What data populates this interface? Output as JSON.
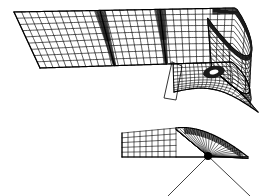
{
  "figure": {
    "title": "",
    "background_color": "#ffffff",
    "line_color": "#000000",
    "width": 271,
    "height": 196
  },
  "chart_data": {
    "type": "line",
    "title": "",
    "xlabel": "",
    "ylabel": "",
    "grid": true,
    "legend": false,
    "panels": [
      {
        "name": "upper-surface-mesh",
        "label": "3D wireframe wing surface",
        "mesh_color": "#000000",
        "planform": {
          "leading_edge": [
            [
              14,
              12
            ],
            [
              236,
              8
            ]
          ],
          "trailing_edge": [
            [
              40,
              68
            ],
            [
              232,
              62
            ]
          ],
          "left_tip": [
            [
              14,
              12
            ],
            [
              40,
              68
            ]
          ],
          "root_chord_x": 236
        },
        "spanwise_divisions": 34,
        "chordwise_divisions": 9,
        "crease_positions_x": [
          100,
          160
        ],
        "crease_shading": "#1a1a1a",
        "rolled_tip": {
          "enabled": true,
          "center": [
            218,
            60
          ],
          "roll_radius_x": 46,
          "roll_radius_y": 34,
          "dark_band_top": true
        },
        "lower_skirt": {
          "enabled": true,
          "start": [
            190,
            62
          ],
          "end": [
            258,
            112
          ],
          "saddle_depth": 22
        },
        "flap_outline": [
          [
            172,
            62
          ],
          [
            164,
            98
          ],
          [
            176,
            100
          ],
          [
            182,
            66
          ]
        ]
      },
      {
        "name": "lower-section-profile",
        "label": "Sectional profile with radial fan mesh",
        "mesh_color": "#000000",
        "flat_grid": {
          "x0": 122,
          "x1": 176,
          "y_top": 133,
          "y_bottom": 157,
          "columns": 9,
          "rows": 5
        },
        "hump": {
          "apex": [
            206,
            124
          ],
          "left_base": [
            176,
            150
          ],
          "right_base": [
            248,
            157
          ],
          "crest_band_dark": true
        },
        "fan": {
          "focus": [
            208,
            156
          ],
          "ray_count": 30,
          "angle_start_deg": 172,
          "angle_end_deg": 8,
          "focus_blob_radius": 4
        },
        "extension_rays": [
          [
            [
              208,
              156
            ],
            [
              168,
              196
            ]
          ],
          [
            [
              208,
              156
            ],
            [
              250,
              196
            ]
          ]
        ]
      }
    ]
  }
}
